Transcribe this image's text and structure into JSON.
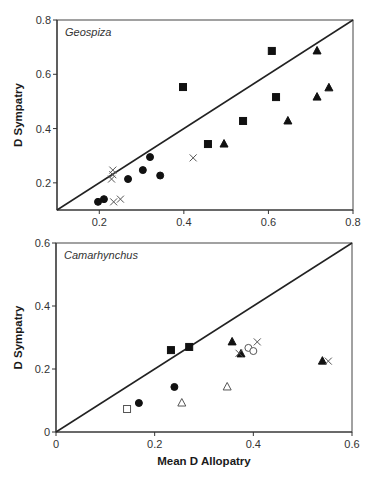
{
  "chart_data": [
    {
      "type": "scatter",
      "panel_label": "Geospiza",
      "xlabel": "",
      "ylabel": "D Sympatry",
      "xlim": [
        0.1,
        0.8
      ],
      "ylim": [
        0.1,
        0.8
      ],
      "xticks": [
        0.2,
        0.4,
        0.6,
        0.8
      ],
      "xtick_labels": [
        "0.2",
        "0.4",
        "0.6",
        "0.8"
      ],
      "yticks": [
        0.2,
        0.4,
        0.6,
        0.8
      ],
      "ytick_labels": [
        "0.2",
        "0.4",
        "0.6",
        "0.8"
      ],
      "grid": false,
      "reference_line": "y = x",
      "frame": {
        "left": 57,
        "top": 20,
        "right": 353,
        "bottom": 210
      },
      "series": [
        {
          "name": "filled-square",
          "marker": "square",
          "filled": true,
          "points": [
            [
              0.608,
              0.686
            ],
            [
              0.398,
              0.553
            ],
            [
              0.618,
              0.516
            ],
            [
              0.54,
              0.428
            ],
            [
              0.457,
              0.343
            ]
          ]
        },
        {
          "name": "filled-triangle",
          "marker": "triangle",
          "filled": true,
          "points": [
            [
              0.715,
              0.686
            ],
            [
              0.743,
              0.55
            ],
            [
              0.715,
              0.516
            ],
            [
              0.646,
              0.428
            ],
            [
              0.495,
              0.343
            ]
          ]
        },
        {
          "name": "filled-circle",
          "marker": "circle",
          "filled": true,
          "points": [
            [
              0.32,
              0.295
            ],
            [
              0.303,
              0.247
            ],
            [
              0.344,
              0.227
            ],
            [
              0.268,
              0.214
            ],
            [
              0.211,
              0.14
            ],
            [
              0.197,
              0.13
            ]
          ]
        },
        {
          "name": "cross",
          "marker": "x",
          "filled": false,
          "points": [
            [
              0.232,
              0.247
            ],
            [
              0.232,
              0.23
            ],
            [
              0.229,
              0.214
            ],
            [
              0.422,
              0.292
            ],
            [
              0.25,
              0.14
            ],
            [
              0.234,
              0.13
            ]
          ]
        }
      ]
    },
    {
      "type": "scatter",
      "panel_label": "Camarhynchus",
      "xlabel": "Mean D Allopatry",
      "ylabel": "D Sympatry",
      "xlim": [
        0,
        0.6
      ],
      "ylim": [
        0,
        0.6
      ],
      "xticks": [
        0,
        0.2,
        0.4,
        0.6
      ],
      "xtick_labels": [
        "0",
        "0.2",
        "0.4",
        "0.6"
      ],
      "yticks": [
        0,
        0.2,
        0.4,
        0.6
      ],
      "ytick_labels": [
        "0",
        "0.2",
        "0.4",
        "0.6"
      ],
      "grid": false,
      "reference_line": "y = x",
      "frame": {
        "left": 56,
        "top": 243,
        "right": 352,
        "bottom": 432
      },
      "series": [
        {
          "name": "filled-square",
          "marker": "square",
          "filled": true,
          "points": [
            [
              0.233,
              0.26
            ],
            [
              0.27,
              0.27
            ]
          ]
        },
        {
          "name": "filled-triangle",
          "marker": "triangle",
          "filled": true,
          "points": [
            [
              0.357,
              0.286
            ],
            [
              0.375,
              0.248
            ],
            [
              0.54,
              0.225
            ]
          ]
        },
        {
          "name": "filled-circle",
          "marker": "circle",
          "filled": true,
          "points": [
            [
              0.24,
              0.143
            ],
            [
              0.168,
              0.092
            ]
          ]
        },
        {
          "name": "open-square",
          "marker": "square",
          "filled": false,
          "points": [
            [
              0.144,
              0.073
            ]
          ]
        },
        {
          "name": "open-triangle",
          "marker": "triangle",
          "filled": false,
          "points": [
            [
              0.255,
              0.092
            ],
            [
              0.347,
              0.143
            ]
          ]
        },
        {
          "name": "open-circle",
          "marker": "circle",
          "filled": false,
          "points": [
            [
              0.39,
              0.267
            ],
            [
              0.4,
              0.257
            ]
          ]
        },
        {
          "name": "cross",
          "marker": "x",
          "filled": false,
          "points": [
            [
              0.371,
              0.25
            ],
            [
              0.408,
              0.286
            ],
            [
              0.552,
              0.225
            ]
          ]
        }
      ]
    }
  ]
}
